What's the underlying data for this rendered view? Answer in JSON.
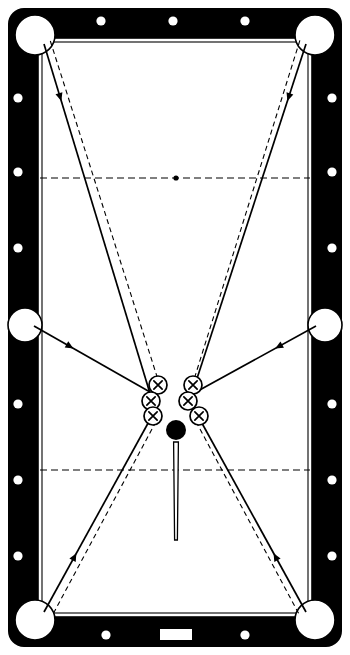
{
  "diagram": {
    "type": "billiards-table-layout",
    "table": {
      "outer": {
        "x": 8,
        "y": 8,
        "width": 334,
        "height": 639,
        "corner_radius": 16
      },
      "rail_color": "#000000",
      "cloth_color": "#ffffff",
      "rail_thickness": 26,
      "cushion_inset": 30,
      "playfield": {
        "x": 38,
        "y": 38,
        "width": 274,
        "height": 579
      }
    },
    "pockets": [
      {
        "name": "corner-pocket-top-left",
        "cx": 35,
        "cy": 35,
        "r": 20
      },
      {
        "name": "corner-pocket-top-right",
        "cx": 315,
        "cy": 35,
        "r": 20
      },
      {
        "name": "side-pocket-left",
        "cx": 25,
        "cy": 325,
        "r": 17
      },
      {
        "name": "side-pocket-right",
        "cx": 325,
        "cy": 325,
        "r": 17
      },
      {
        "name": "corner-pocket-bottom-left",
        "cx": 35,
        "cy": 620,
        "r": 20
      },
      {
        "name": "corner-pocket-bottom-right",
        "cx": 315,
        "cy": 620,
        "r": 20
      }
    ],
    "sight_dots": [
      {
        "name": "top-rail-dot-1",
        "cx": 101,
        "cy": 21,
        "r": 4.6
      },
      {
        "name": "top-rail-dot-2",
        "cx": 173,
        "cy": 21,
        "r": 4.6
      },
      {
        "name": "top-rail-dot-3",
        "cx": 245,
        "cy": 21,
        "r": 4.6
      },
      {
        "name": "bottom-rail-dot-1",
        "cx": 106,
        "cy": 635,
        "r": 4.6
      },
      {
        "name": "bottom-rail-dot-2",
        "cx": 245,
        "cy": 635,
        "r": 4.6
      },
      {
        "name": "left-rail-dot-1",
        "cx": 18,
        "cy": 98,
        "r": 4.6
      },
      {
        "name": "left-rail-dot-2",
        "cx": 18,
        "cy": 172,
        "r": 4.6
      },
      {
        "name": "left-rail-dot-3",
        "cx": 18,
        "cy": 248,
        "r": 4.6
      },
      {
        "name": "left-rail-dot-4",
        "cx": 18,
        "cy": 404,
        "r": 4.6
      },
      {
        "name": "left-rail-dot-5",
        "cx": 18,
        "cy": 480,
        "r": 4.6
      },
      {
        "name": "left-rail-dot-6",
        "cx": 18,
        "cy": 556,
        "r": 4.6
      },
      {
        "name": "right-rail-dot-1",
        "cx": 332,
        "cy": 98,
        "r": 4.6
      },
      {
        "name": "right-rail-dot-2",
        "cx": 332,
        "cy": 172,
        "r": 4.6
      },
      {
        "name": "right-rail-dot-3",
        "cx": 332,
        "cy": 248,
        "r": 4.6
      },
      {
        "name": "right-rail-dot-4",
        "cx": 332,
        "cy": 404,
        "r": 4.6
      },
      {
        "name": "right-rail-dot-5",
        "cx": 332,
        "cy": 480,
        "r": 4.6
      },
      {
        "name": "right-rail-dot-6",
        "cx": 332,
        "cy": 556,
        "r": 4.6
      }
    ],
    "nameplate": {
      "name": "bottom-rail-nameplate",
      "x": 160,
      "y": 629,
      "width": 32,
      "height": 11
    },
    "strings": [
      {
        "name": "head-string",
        "y": 178,
        "x1": 40,
        "x2": 310,
        "has_spot": true,
        "spot_x": 176,
        "spot_r": 2.6
      },
      {
        "name": "foot-string",
        "y": 470,
        "x1": 40,
        "x2": 310,
        "has_spot": false
      }
    ],
    "object_balls": [
      {
        "name": "object-ball-left-1",
        "cx": 158,
        "cy": 385,
        "r": 9,
        "mark": "X"
      },
      {
        "name": "object-ball-left-2",
        "cx": 151,
        "cy": 401,
        "r": 9,
        "mark": "X"
      },
      {
        "name": "object-ball-left-3",
        "cx": 153,
        "cy": 416,
        "r": 9,
        "mark": "X"
      },
      {
        "name": "object-ball-right-1",
        "cx": 193,
        "cy": 385,
        "r": 9,
        "mark": "X"
      },
      {
        "name": "object-ball-right-2",
        "cx": 188,
        "cy": 401,
        "r": 9,
        "mark": "X"
      },
      {
        "name": "object-ball-right-3",
        "cx": 199,
        "cy": 416,
        "r": 9,
        "mark": "X"
      }
    ],
    "cue_ball": {
      "name": "cue-ball",
      "cx": 176,
      "cy": 430,
      "r": 10,
      "fill": "#000000"
    },
    "cue_stick": {
      "name": "cue-stick",
      "tip_x": 176,
      "tip_y": 442,
      "butt_x": 176,
      "butt_y": 540,
      "tip_half_width": 2.4,
      "butt_half_width": 1.4
    },
    "trajectories": [
      {
        "name": "shot-left-cluster-to-top-left-pocket",
        "solid": [
          [
            152,
            400
          ],
          [
            44,
            44
          ]
        ],
        "dashed": [
          [
            160,
            386
          ],
          [
            50,
            40
          ]
        ],
        "arrow_t": 0.84
      },
      {
        "name": "shot-right-cluster-to-top-right-pocket",
        "solid": [
          [
            190,
            400
          ],
          [
            306,
            44
          ]
        ],
        "dashed": [
          [
            192,
            386
          ],
          [
            300,
            40
          ]
        ],
        "arrow_t": 0.84
      },
      {
        "name": "shot-left-cluster-to-bottom-left-pocket",
        "solid": [
          [
            152,
            416
          ],
          [
            44,
            612
          ]
        ],
        "dashed": [
          [
            160,
            414
          ],
          [
            52,
            616
          ]
        ],
        "arrow_t": 0.7
      },
      {
        "name": "shot-right-cluster-to-bottom-right-pocket",
        "solid": [
          [
            198,
            416
          ],
          [
            306,
            612
          ]
        ],
        "dashed": [
          [
            192,
            414
          ],
          [
            300,
            616
          ]
        ],
        "arrow_t": 0.7
      },
      {
        "name": "shot-left-cluster-to-left-side-pocket",
        "solid": [
          [
            150,
            392
          ],
          [
            34,
            326
          ]
        ],
        "dashed": null,
        "arrow_t": 0.66
      },
      {
        "name": "shot-right-cluster-to-right-side-pocket",
        "solid": [
          [
            196,
            392
          ],
          [
            316,
            326
          ]
        ],
        "dashed": null,
        "arrow_t": 0.66
      }
    ],
    "colors": {
      "rail": "#000000",
      "cloth": "#ffffff",
      "line": "#000000",
      "pocket": "#ffffff"
    }
  }
}
